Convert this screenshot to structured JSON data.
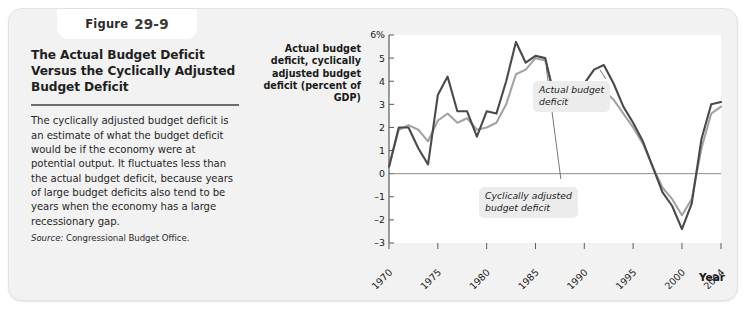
{
  "figure": {
    "tab_word": "Figure",
    "tab_number": "29-9",
    "title": "The Actual Budget Deficit Versus the Cyclically Adjusted Budget Deficit",
    "body": "The cyclically adjusted budget deficit is an estimate of what the budget deficit would be if the economy were at potential output. It fluctuates less than the actual budget deficit, because years of large budget deficits also tend to be years when the economy has a large recessionary gap.",
    "source_label": "Source:",
    "source_text": "Congressional Budget Office."
  },
  "annotations": {
    "actual": "Actual budget\ndeficit",
    "cyclical": "Cyclically adjusted\nbudget deficit"
  },
  "axis": {
    "year_label": "Year"
  },
  "colors": {
    "actual_line": "#4a4a4a",
    "cyclical_line": "#a3a3a3",
    "zero_line": "#8c8c8c",
    "axis": "#5a5a5a",
    "card_bg": "#f2f2f2",
    "plot_bg": "#ffffff"
  },
  "chart_data": {
    "type": "line",
    "title": "The Actual Budget Deficit Versus the Cyclically Adjusted Budget Deficit",
    "xlabel": "Year",
    "ylabel": "Actual budget deficit, cyclically adjusted budget deficit (percent of GDP)",
    "xlim": [
      1970,
      2004
    ],
    "ylim": [
      -3,
      6
    ],
    "yticks": [
      6,
      5,
      4,
      3,
      2,
      1,
      0,
      -1,
      -2,
      -3
    ],
    "ytick_labels": [
      "6%",
      "5",
      "4",
      "3",
      "2",
      "1",
      "0",
      "-1",
      "-2",
      "-3"
    ],
    "xticks": [
      1970,
      1975,
      1980,
      1985,
      1990,
      1995,
      2000,
      2004
    ],
    "xtick_labels": [
      "1970",
      "1975",
      "1980",
      "1985",
      "1990",
      "1995",
      "2000",
      "2004"
    ],
    "grid": false,
    "legend": "annotations-inline",
    "x": [
      1970,
      1971,
      1972,
      1973,
      1974,
      1975,
      1976,
      1977,
      1978,
      1979,
      1980,
      1981,
      1982,
      1983,
      1984,
      1985,
      1986,
      1987,
      1988,
      1989,
      1990,
      1991,
      1992,
      1993,
      1994,
      1995,
      1996,
      1997,
      1998,
      1999,
      2000,
      2001,
      2002,
      2003,
      2004
    ],
    "series": [
      {
        "name": "Actual budget deficit",
        "color": "#4a4a4a",
        "values": [
          0.3,
          2.0,
          2.0,
          1.1,
          0.4,
          3.4,
          4.2,
          2.7,
          2.7,
          1.6,
          2.7,
          2.6,
          4.0,
          5.7,
          4.8,
          5.1,
          5.0,
          3.2,
          3.1,
          2.8,
          3.9,
          4.5,
          4.7,
          3.9,
          2.9,
          2.2,
          1.4,
          0.3,
          -0.8,
          -1.4,
          -2.4,
          -1.3,
          1.5,
          3.0,
          3.1
        ]
      },
      {
        "name": "Cyclically adjusted budget deficit",
        "color": "#a3a3a3",
        "values": [
          0.3,
          1.9,
          2.1,
          1.9,
          1.4,
          2.3,
          2.6,
          2.2,
          2.4,
          1.9,
          2.0,
          2.2,
          3.0,
          4.3,
          4.5,
          5.0,
          4.9,
          3.3,
          3.0,
          2.9,
          3.4,
          3.6,
          3.6,
          3.2,
          2.6,
          2.0,
          1.3,
          0.3,
          -0.6,
          -1.1,
          -1.8,
          -1.1,
          1.1,
          2.6,
          2.9
        ]
      }
    ]
  }
}
